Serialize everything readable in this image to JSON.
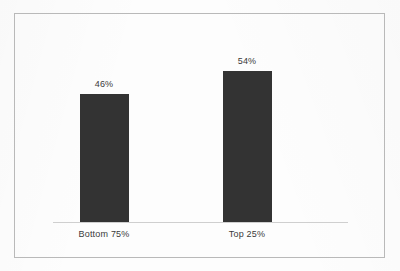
{
  "chart_data": {
    "type": "bar",
    "title": "",
    "subtitle": "",
    "xlabel": "",
    "ylabel": "",
    "categories": [
      "Bottom 75%",
      "Top 25%"
    ],
    "values": [
      46,
      54
    ],
    "value_labels": [
      "46%",
      "54%"
    ],
    "ylim": [
      0,
      62
    ],
    "grid": false,
    "legend": false,
    "legend_position": "none",
    "bar_color": "#333333",
    "axis_color": "#cfcfcf",
    "border_color": "#b9b9b9",
    "label_color": "#3a3a3a",
    "background_color": "#fdfdfd"
  }
}
